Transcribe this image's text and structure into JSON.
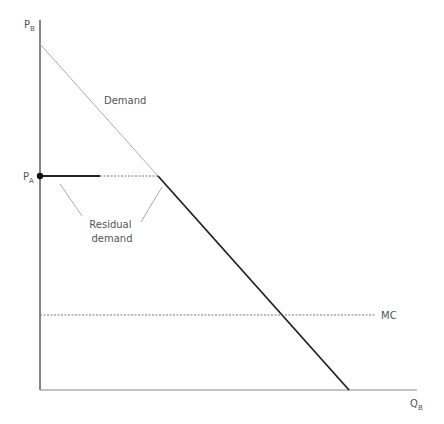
{
  "diagram": {
    "axes": {
      "y_label": "P",
      "y_sub": "B",
      "x_label": "Q",
      "x_sub": "B"
    },
    "labels": {
      "demand": "Demand",
      "pa": "P",
      "pa_sub": "A",
      "residual_line1": "Residual",
      "residual_line2": "demand",
      "mc": "MC"
    },
    "colors": {
      "axis": "#333333",
      "demand": "#aaaaaa",
      "residual": "#222222",
      "dashed": "#888888",
      "text": "#555555"
    }
  }
}
